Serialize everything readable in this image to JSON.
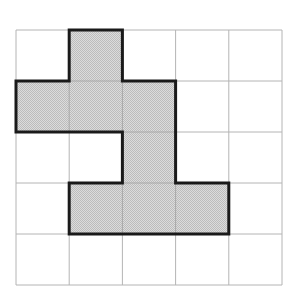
{
  "figure": {
    "name": "grid-polyomino-figure",
    "background_color": "#ffffff"
  },
  "grid": {
    "rows": 5,
    "columns": 5,
    "origin_x": 16,
    "origin_y": 30,
    "cell_width": 53.2,
    "cell_height": 51.0,
    "line_color": "#b4b4b4",
    "line_width": 1,
    "outer_border_color": "#b4b4b4"
  },
  "shape": {
    "fill_color": "#cccccc",
    "fill_pattern": "checkered-dither",
    "fill_pattern_dark": "#b8b8b8",
    "fill_pattern_light": "#e0e0e0",
    "outline_color": "#1a1a1a",
    "outline_width": 3,
    "shaded_cells": [
      {
        "row": 1,
        "col": 2
      },
      {
        "row": 2,
        "col": 1
      },
      {
        "row": 2,
        "col": 2
      },
      {
        "row": 2,
        "col": 3
      },
      {
        "row": 3,
        "col": 3
      },
      {
        "row": 4,
        "col": 2
      },
      {
        "row": 4,
        "col": 3
      },
      {
        "row": 4,
        "col": 4
      }
    ],
    "shaded_cell_count": 8,
    "outline_path_points": [
      [
        1,
        0
      ],
      [
        2,
        0
      ],
      [
        2,
        1
      ],
      [
        3,
        1
      ],
      [
        3,
        3
      ],
      [
        4,
        3
      ],
      [
        4,
        4
      ],
      [
        1,
        4
      ],
      [
        1,
        3
      ],
      [
        2,
        3
      ],
      [
        2,
        2
      ],
      [
        0,
        2
      ],
      [
        0,
        1
      ],
      [
        1,
        1
      ],
      [
        1,
        0
      ]
    ]
  }
}
